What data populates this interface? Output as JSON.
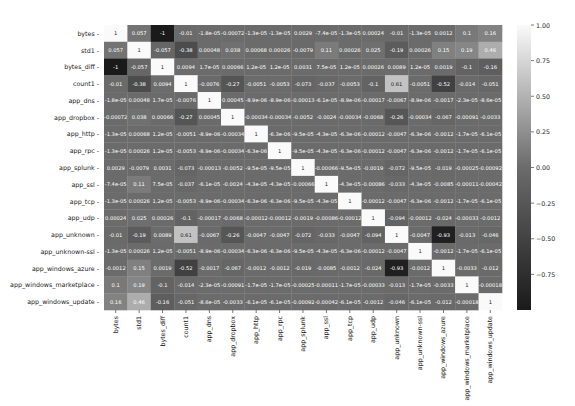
{
  "chart_data": {
    "type": "heatmap",
    "title": "",
    "labels": [
      "bytes",
      "std1",
      "bytes_diff",
      "count1",
      "app_dns",
      "app_dropbox",
      "app_http",
      "app_rpc",
      "app_splunk",
      "app_ssl",
      "app_tcp",
      "app_udp",
      "app_unknown",
      "app_unknown-ssl",
      "app_windows_azure",
      "app_windows_marketplace",
      "app_windows_update"
    ],
    "matrix_display": [
      [
        "1",
        "0.057",
        "-1",
        "-0.01",
        "-1.8e-05",
        "-0.00072",
        "-1.3e-05",
        "-1.3e-05",
        "0.0029",
        "-7.4e-05",
        "-1.3e-05",
        "0.00024",
        "-0.01",
        "-1.3e-05",
        "0.0012",
        "0.1",
        "0.16"
      ],
      [
        "0.057",
        "1",
        "-0.057",
        "-0.38",
        "0.00048",
        "0.038",
        "0.00068",
        "0.00026",
        "-0.0079",
        "0.11",
        "0.00026",
        "0.025",
        "-0.19",
        "0.00026",
        "0.15",
        "0.19",
        "0.46"
      ],
      [
        "-1",
        "-0.057",
        "1",
        "0.0094",
        "1.7e-05",
        "0.00066",
        "1.2e-05",
        "1.2e-05",
        "0.0031",
        "7.5e-05",
        "1.2e-05",
        "0.00026",
        "0.0089",
        "1.2e-05",
        "0.0019",
        "-0.1",
        "-0.16"
      ],
      [
        "-0.01",
        "-0.38",
        "0.0094",
        "1",
        "-0.0076",
        "-0.27",
        "-0.0051",
        "-0.0053",
        "-0.073",
        "-0.037",
        "-0.0053",
        "-0.1",
        "0.61",
        "-0.0051",
        "-0.52",
        "-0.014",
        "-0.051"
      ],
      [
        "-1.8e-05",
        "0.00048",
        "1.7e-05",
        "-0.0076",
        "1",
        "0.00045",
        "-8.9e-06",
        "-8.9e-06",
        "-0.00013",
        "-6.1e-05",
        "-8.9e-06",
        "-0.00017",
        "-0.0067",
        "-8.9e-06",
        "-0.0017",
        "-2.3e-05",
        "-8.6e-05"
      ],
      [
        "-0.00072",
        "0.038",
        "0.00066",
        "-0.27",
        "0.00045",
        "1",
        "-0.00034",
        "-0.00034",
        "-0.0052",
        "-0.0024",
        "-0.00034",
        "-0.0068",
        "-0.26",
        "-0.00034",
        "-0.067",
        "-0.00091",
        "-0.0033"
      ],
      [
        "-1.3e-05",
        "0.00068",
        "1.2e-05",
        "-0.0051",
        "-8.9e-06",
        "-0.00034",
        "1",
        "-6.3e-06",
        "-9.5e-05",
        "-4.3e-05",
        "-6.3e-06",
        "-0.00012",
        "-0.0047",
        "-6.3e-06",
        "-0.0012",
        "-1.7e-05",
        "-6.1e-05"
      ],
      [
        "-1.3e-05",
        "0.00026",
        "1.2e-05",
        "-0.0053",
        "-8.9e-06",
        "-0.00034",
        "-6.3e-06",
        "1",
        "-9.5e-05",
        "-4.3e-05",
        "-6.3e-06",
        "-0.00012",
        "-0.0047",
        "-6.3e-06",
        "-0.0012",
        "-1.7e-05",
        "-6.1e-05"
      ],
      [
        "0.0029",
        "-0.0079",
        "0.0031",
        "-0.073",
        "-0.00013",
        "-0.0052",
        "-9.5e-05",
        "-9.5e-05",
        "1",
        "-0.00066",
        "-9.5e-05",
        "-0.0019",
        "-0.072",
        "-9.5e-05",
        "-0.019",
        "-0.00025",
        "-0.00092"
      ],
      [
        "-7.4e-05",
        "0.11",
        "7.5e-05",
        "-0.037",
        "-6.1e-05",
        "-0.0024",
        "-4.3e-05",
        "-4.3e-05",
        "-0.00066",
        "1",
        "-4.3e-05",
        "-0.00086",
        "-0.033",
        "-4.3e-05",
        "-0.0085",
        "-0.00011",
        "-0.00042"
      ],
      [
        "-1.3e-05",
        "0.00026",
        "1.2e-05",
        "-0.0053",
        "-8.9e-06",
        "-0.00034",
        "-6.3e-06",
        "-6.3e-06",
        "-9.5e-05",
        "-4.3e-05",
        "1",
        "-0.00012",
        "-0.0047",
        "-6.3e-06",
        "-0.0012",
        "-1.7e-05",
        "-6.1e-05"
      ],
      [
        "0.00024",
        "0.025",
        "0.00026",
        "-0.1",
        "-0.00017",
        "-0.0068",
        "-0.00012",
        "-0.00012",
        "-0.0019",
        "-0.00086",
        "-0.00012",
        "1",
        "-0.094",
        "-0.00012",
        "-0.024",
        "-0.00033",
        "-0.0012"
      ],
      [
        "-0.01",
        "-0.19",
        "0.0089",
        "0.61",
        "-0.0067",
        "-0.26",
        "-0.0047",
        "-0.0047",
        "-0.072",
        "-0.033",
        "-0.0047",
        "-0.094",
        "1",
        "-0.0047",
        "-0.93",
        "-0.013",
        "-0.046"
      ],
      [
        "-1.3e-05",
        "0.00026",
        "1.2e-05",
        "-0.0051",
        "-8.9e-06",
        "-0.00034",
        "-6.3e-06",
        "-6.3e-06",
        "-9.5e-05",
        "-4.3e-05",
        "-6.3e-06",
        "-0.00012",
        "-0.0047",
        "1",
        "-0.0012",
        "-1.7e-05",
        "-6.1e-05"
      ],
      [
        "-0.0012",
        "0.15",
        "0.0019",
        "-0.52",
        "-0.0017",
        "-0.067",
        "-0.0012",
        "-0.0012",
        "-0.019",
        "-0.0085",
        "-0.0012",
        "-0.024",
        "-0.93",
        "-0.0012",
        "1",
        "-0.0033",
        "-0.012"
      ],
      [
        "0.1",
        "0.19",
        "-0.1",
        "-0.014",
        "-2.3e-05",
        "-0.00091",
        "-1.7e-05",
        "-1.7e-05",
        "-0.00025",
        "-0.00011",
        "-1.7e-05",
        "-0.00033",
        "-0.013",
        "-1.7e-05",
        "-0.0033",
        "1",
        "-0.00018"
      ],
      [
        "0.16",
        "0.46",
        "-0.16",
        "-0.051",
        "-8.6e-05",
        "-0.0033",
        "-6.1e-05",
        "-6.1e-05",
        "-0.00092",
        "-0.00042",
        "-6.1e-05",
        "-0.0012",
        "-0.046",
        "-6.1e-05",
        "-0.012",
        "-0.00018",
        "1"
      ]
    ],
    "colorbar": {
      "vmin": -1.0,
      "vmax": 1.0,
      "ticks": [
        "1.00",
        "0.75",
        "0.50",
        "0.25",
        "0.00",
        "−0.25",
        "−0.50",
        "−0.75"
      ],
      "tick_values": [
        1.0,
        0.75,
        0.5,
        0.25,
        0.0,
        -0.25,
        -0.5,
        -0.75
      ],
      "colormap": "grayscale (dark = negative, light = positive)"
    },
    "annot": true,
    "grid": false,
    "legend_position": "right (colorbar)"
  },
  "colors": {
    "low": "#1a1a1a",
    "mid": "#6b6b6b",
    "high": "#fafafa",
    "text_dark": "#222222",
    "text_light": "#ffffff"
  }
}
